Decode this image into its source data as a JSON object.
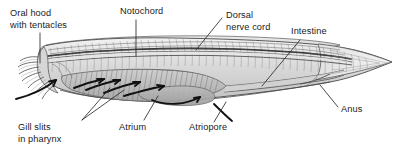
{
  "figure": {
    "background_color": "#ffffff",
    "line_color": "#4a4a4a",
    "text_color": "#1a1a1a",
    "orientation": "anterior at left, posterior at right"
  },
  "labels": [
    {
      "id": "oral-hood",
      "line1": "Oral hood",
      "line2": "with tentacles",
      "text_x": 10,
      "text_y": 14,
      "align": "start"
    },
    {
      "id": "notochord",
      "line1": "Notochord",
      "line2": "",
      "text_x": 120,
      "text_y": 14,
      "align": "start"
    },
    {
      "id": "dorsal-nerve-cord",
      "line1": "Dorsal",
      "line2": "nerve cord",
      "text_x": 224,
      "text_y": 18,
      "align": "start"
    },
    {
      "id": "intestine",
      "line1": "Intestine",
      "line2": "",
      "text_x": 291,
      "text_y": 34,
      "align": "start"
    },
    {
      "id": "anus",
      "line1": "Anus",
      "line2": "",
      "text_x": 341,
      "text_y": 112,
      "align": "start"
    },
    {
      "id": "atriopore",
      "line1": "Atriopore",
      "line2": "",
      "text_x": 189,
      "text_y": 128,
      "align": "start"
    },
    {
      "id": "atrium",
      "line1": "Atrium",
      "line2": "",
      "text_x": 119,
      "text_y": 128,
      "align": "start"
    },
    {
      "id": "gill-slits",
      "line1": "Gill slits",
      "line2": "in pharynx",
      "text_x": 18,
      "text_y": 128,
      "align": "start"
    }
  ],
  "structures": {
    "oral_hood": "anterior funnel fringed with buccal tentacles",
    "notochord": "dorsal stiff rod running full body length",
    "dorsal_nerve_cord": "narrow tube lying just above the notochord",
    "pharynx": "large anterior chamber with numerous angled gill bars",
    "atrium": "cavity surrounding the pharynx, ventral region",
    "atriopore": "ventral opening posterior to the atrium",
    "intestine": "tube running posteriorly from the pharynx",
    "anus": "posterior ventral opening near the tail fin",
    "water_flow_arrows": "dark arrows showing water entering mouth, crossing gill bars and exiting the atriopore"
  }
}
